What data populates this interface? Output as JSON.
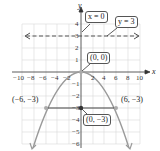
{
  "diagram": {
    "type": "parabola-graph",
    "equation": "x^2 = -12y",
    "axes": {
      "x_label": "x",
      "y_label": "y",
      "x_ticks": [
        "−10",
        "−8",
        "−6",
        "−4",
        "−2",
        "2",
        "4",
        "6",
        "8",
        "10"
      ],
      "y_ticks": [
        "4",
        "3",
        "2",
        "1",
        "−1",
        "−2",
        "−3",
        "−4",
        "−5",
        "−6"
      ],
      "xlim": [
        -10,
        10
      ],
      "ylim": [
        -6,
        4
      ]
    },
    "annotations": {
      "axis_of_symmetry": "x = 0",
      "directrix": "y = 3",
      "vertex": "(0, 0)",
      "focus": "(0, −3)",
      "left_endpoint": "(−6, −3)",
      "right_endpoint": "(6, −3)"
    },
    "colors": {
      "curve": "#9a9a9a",
      "grid": "#d8d8d8",
      "axis": "#333333",
      "directrix": "#555555",
      "point": "#444444"
    }
  }
}
